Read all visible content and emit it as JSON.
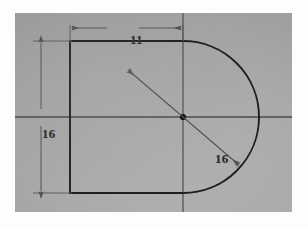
{
  "document": {
    "kind": "engineering-sketch-photo",
    "media": "hand drawing on gray paper"
  },
  "colors": {
    "paper": "#a8a8a8",
    "outline": "#1d1d1d",
    "centerline": "#3a3a3a",
    "dimension": "#4a4a4a",
    "text": "#2a2a2a",
    "page_background": "#ffffff"
  },
  "dimensions": {
    "width": {
      "label": "11",
      "orientation": "horizontal",
      "position": "top",
      "describes": "rectangle width from left edge to vertical centerline"
    },
    "height": {
      "label": "16",
      "orientation": "vertical",
      "position": "left",
      "describes": "rectangle height from top edge to bottom edge"
    },
    "radius": {
      "label": "16",
      "orientation": "diagonal",
      "position": "lower-right",
      "describes": "radius of the arc measured from the center point"
    }
  },
  "geometry": {
    "rectangle": {
      "left": 70,
      "top": 41,
      "right": 183,
      "bottom": 193
    },
    "arc": {
      "center_x": 183,
      "center_y": 117,
      "radius": 80,
      "start_angle_deg": -90,
      "end_angle_deg": 90,
      "sweep": "right half, clockwise from top to bottom"
    },
    "center_point": {
      "x": 183,
      "y": 117,
      "marker": "filled dot"
    },
    "centerlines": {
      "horizontal": {
        "y": 117,
        "x_start": 15,
        "x_end": 291
      },
      "vertical": {
        "x": 183,
        "y_start": 13,
        "y_end": 211
      }
    },
    "leaders": [
      {
        "name": "upper-left radius leader",
        "from": [
          183,
          117
        ],
        "to": [
          126,
          68
        ],
        "arrow_at": "to"
      },
      {
        "name": "lower-right radius leader",
        "from": [
          183,
          117
        ],
        "to": [
          240,
          166
        ],
        "arrow_at": "to"
      }
    ]
  }
}
